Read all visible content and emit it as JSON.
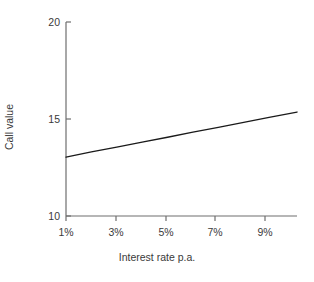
{
  "chart_data": {
    "type": "line",
    "title": "",
    "subtitle": "",
    "xlabel": "Interest rate p.a.",
    "ylabel": "Call value",
    "xlim": [
      1,
      10.1
    ],
    "ylim": [
      10,
      20
    ],
    "grid": false,
    "legend": false,
    "legend_position": "none",
    "xticks": [
      1,
      3,
      5,
      7,
      9
    ],
    "xtick_labels": [
      "1%",
      "3%",
      "5%",
      "7%",
      "9%"
    ],
    "yticks": [
      10,
      15,
      20
    ],
    "ytick_labels": [
      "10",
      "15",
      "20"
    ],
    "series": [
      {
        "name": "Call value",
        "color": "#1a1a1a",
        "x": [
          1,
          2,
          3,
          4,
          5,
          6,
          7,
          8,
          9,
          10.1
        ],
        "values": [
          13.04,
          13.3,
          13.55,
          13.81,
          14.06,
          14.32,
          14.57,
          14.83,
          15.08,
          15.36
        ]
      }
    ],
    "annotations": []
  },
  "axes": {
    "y_title": "Call value",
    "x_title": "Interest rate p.a.",
    "y_labels": [
      "20",
      "15",
      "10"
    ],
    "x_labels": [
      "1%",
      "3%",
      "5%",
      "7%",
      "9%"
    ]
  },
  "colors": {
    "line": "#1a1a1a",
    "axis": "#6e6e6e",
    "text": "#3a3a3a",
    "background": "#ffffff"
  }
}
